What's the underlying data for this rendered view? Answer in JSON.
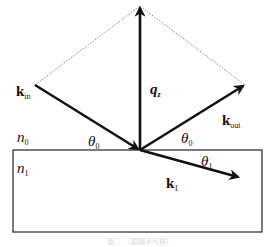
{
  "diagram": {
    "type": "wave-vector reflection/refraction geometry",
    "colors": {
      "line": "#111111",
      "dashed": "#555555",
      "caption": "#d8d8d8"
    },
    "vectors": [
      {
        "id": "k_in",
        "label": "k",
        "sub": "in",
        "from": [
          35,
          85
        ],
        "to": [
          140,
          150
        ]
      },
      {
        "id": "q_z",
        "label": "q",
        "sub": "z",
        "from": [
          140,
          150
        ],
        "to": [
          140,
          6
        ]
      },
      {
        "id": "k_out",
        "label": "k",
        "sub": "out",
        "from": [
          140,
          150
        ],
        "to": [
          245,
          85
        ]
      },
      {
        "id": "k_1",
        "label": "k",
        "sub": "1",
        "from": [
          140,
          150
        ],
        "to": [
          240,
          178
        ]
      }
    ],
    "dashed_lines": [
      {
        "from": [
          35,
          85
        ],
        "to": [
          140,
          6
        ]
      },
      {
        "from": [
          140,
          6
        ],
        "to": [
          245,
          85
        ]
      }
    ],
    "labels": {
      "n0": {
        "base": "n",
        "sub": "0"
      },
      "n1": {
        "base": "n",
        "sub": "1"
      },
      "theta0_left": {
        "base": "θ",
        "sub": "0"
      },
      "theta0_right": {
        "base": "θ",
        "sub": "0"
      },
      "theta1": {
        "base": "θ",
        "sub": "1"
      },
      "k_in": {
        "base": "k",
        "sub": "in"
      },
      "q_z": {
        "base": "q",
        "sub": "z"
      },
      "k_out": {
        "base": "k",
        "sub": "out"
      },
      "k_1": {
        "base": "k",
        "sub": "1"
      }
    },
    "medium": {
      "interface_y": 150,
      "box": [
        13,
        150,
        262,
        232
      ]
    },
    "caption": "图 …（模糊不可辨）"
  }
}
